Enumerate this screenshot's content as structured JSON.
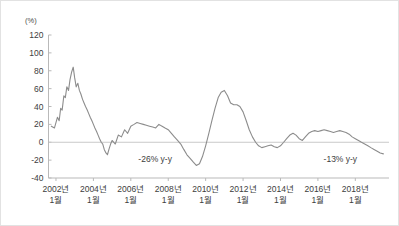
{
  "chart_data": {
    "type": "line",
    "title": "",
    "subtitle": "",
    "xlabel": "",
    "ylabel": "",
    "unit_label": "(%)",
    "ylim": [
      -40,
      120
    ],
    "ytick_values": [
      120,
      100,
      80,
      60,
      40,
      20,
      0,
      -20,
      -40
    ],
    "ytick_labels": [
      "120",
      "100",
      "80",
      "60",
      "40",
      "20",
      "0",
      "-20",
      "-40"
    ],
    "grid": false,
    "zero_line": true,
    "legend": "none",
    "line_color": "#8c8c8c",
    "axis_color": "#b9b9b9",
    "zero_line_color": "#c9c9c9",
    "xtick_labels": [
      {
        "year": "2002년",
        "month": "1월"
      },
      {
        "year": "2004년",
        "month": "1월"
      },
      {
        "year": "2006년",
        "month": "1월"
      },
      {
        "year": "2008년",
        "month": "1월"
      },
      {
        "year": "2010년",
        "month": "1월"
      },
      {
        "year": "2012년",
        "month": "1월"
      },
      {
        "year": "2014년",
        "month": "1월"
      },
      {
        "year": "2016년",
        "month": "1월"
      },
      {
        "year": "2018년",
        "month": "1월"
      }
    ],
    "xtick_x_values": [
      2002.0,
      2004.0,
      2006.0,
      2008.0,
      2010.0,
      2012.0,
      2014.0,
      2016.0,
      2018.0
    ],
    "xlim": [
      2001.6,
      2019.8
    ],
    "annotations": [
      {
        "text": "-26% y-y",
        "x": 2007.3,
        "y": -22
      },
      {
        "text": "-13% y-y",
        "x": 2017.2,
        "y": -22
      }
    ],
    "x": [
      2001.75,
      2001.92,
      2002.08,
      2002.17,
      2002.25,
      2002.33,
      2002.42,
      2002.5,
      2002.58,
      2002.67,
      2002.75,
      2002.83,
      2002.92,
      2003.0,
      2003.08,
      2003.17,
      2003.25,
      2003.33,
      2003.42,
      2003.5,
      2003.58,
      2003.67,
      2003.75,
      2003.83,
      2003.92,
      2004.0,
      2004.08,
      2004.17,
      2004.25,
      2004.33,
      2004.42,
      2004.5,
      2004.58,
      2004.67,
      2004.75,
      2004.83,
      2004.92,
      2005.0,
      2005.17,
      2005.33,
      2005.5,
      2005.67,
      2005.83,
      2006.0,
      2006.17,
      2006.33,
      2006.5,
      2006.67,
      2006.83,
      2007.0,
      2007.17,
      2007.33,
      2007.5,
      2007.67,
      2007.83,
      2008.0,
      2008.17,
      2008.33,
      2008.5,
      2008.67,
      2008.83,
      2009.0,
      2009.17,
      2009.33,
      2009.5,
      2009.67,
      2009.83,
      2010.0,
      2010.17,
      2010.33,
      2010.5,
      2010.67,
      2010.83,
      2011.0,
      2011.17,
      2011.33,
      2011.5,
      2011.67,
      2011.83,
      2012.0,
      2012.17,
      2012.33,
      2012.5,
      2012.67,
      2012.83,
      2013.0,
      2013.17,
      2013.33,
      2013.5,
      2013.67,
      2013.83,
      2014.0,
      2014.17,
      2014.33,
      2014.5,
      2014.67,
      2014.83,
      2015.0,
      2015.17,
      2015.33,
      2015.5,
      2015.67,
      2015.83,
      2016.0,
      2016.17,
      2016.33,
      2016.5,
      2016.67,
      2016.83,
      2017.0,
      2017.17,
      2017.33,
      2017.5,
      2017.67,
      2017.83,
      2018.0,
      2018.17,
      2018.33,
      2018.5,
      2018.67,
      2018.83,
      2019.0,
      2019.17,
      2019.33,
      2019.5
    ],
    "values": [
      18,
      16,
      28,
      24,
      38,
      36,
      52,
      50,
      62,
      58,
      70,
      78,
      84,
      72,
      62,
      66,
      58,
      54,
      48,
      44,
      40,
      36,
      32,
      28,
      24,
      20,
      16,
      12,
      8,
      4,
      0,
      -2,
      -8,
      -12,
      -14,
      -8,
      -2,
      2,
      -2,
      8,
      6,
      14,
      10,
      18,
      20,
      22,
      21,
      20,
      19,
      18,
      17,
      16,
      20,
      18,
      16,
      14,
      10,
      6,
      2,
      -2,
      -8,
      -14,
      -18,
      -22,
      -26,
      -24,
      -16,
      -4,
      10,
      24,
      38,
      50,
      56,
      58,
      52,
      44,
      42,
      42,
      40,
      34,
      24,
      14,
      6,
      0,
      -4,
      -6,
      -5,
      -4,
      -3,
      -5,
      -6,
      -4,
      0,
      4,
      8,
      10,
      8,
      4,
      2,
      6,
      10,
      12,
      13,
      12,
      13,
      14,
      13,
      12,
      11,
      12,
      13,
      12,
      11,
      9,
      6,
      4,
      2,
      0,
      -2,
      -4,
      -6,
      -8,
      -10,
      -12,
      -13
    ]
  }
}
